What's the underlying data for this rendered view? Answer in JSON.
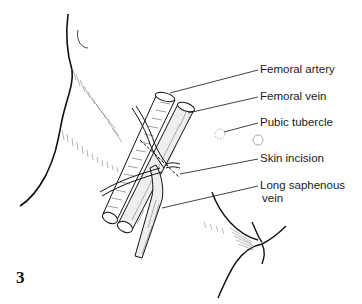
{
  "figure": {
    "number": "3"
  },
  "labels": [
    {
      "id": "femoral-artery",
      "text": "Femoral artery"
    },
    {
      "id": "femoral-vein",
      "text": "Femoral vein"
    },
    {
      "id": "pubic-tubercle",
      "text": "Pubic tubercle"
    },
    {
      "id": "skin-incision",
      "text": "Skin incision"
    },
    {
      "id": "long-saphenous-vein",
      "line1": "Long saphenous",
      "line2": "vein"
    }
  ],
  "colors": {
    "ink": "#1a1a1a",
    "background": "#ffffff"
  }
}
